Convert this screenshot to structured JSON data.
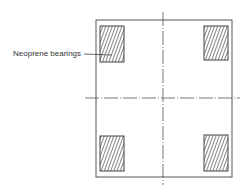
{
  "diagram": {
    "type": "plan view",
    "label": "Neoprene bearings",
    "colors": {
      "line": "#555555",
      "hatch": "#444444",
      "background": "#ffffff"
    },
    "elements": {
      "slab": {
        "x": 96,
        "y": 20,
        "width": 136,
        "height": 157
      },
      "bearings": [
        {
          "position": "top-left",
          "x": 100,
          "y": 26,
          "width": 24,
          "height": 36
        },
        {
          "position": "top-right",
          "x": 204,
          "y": 26,
          "width": 24,
          "height": 34
        },
        {
          "position": "bottom-left",
          "x": 100,
          "y": 136,
          "width": 24,
          "height": 35
        },
        {
          "position": "bottom-right",
          "x": 204,
          "y": 135,
          "width": 24,
          "height": 36
        }
      ],
      "centerlines": [
        {
          "orientation": "vertical",
          "x": 163,
          "y1": 12,
          "y2": 185
        },
        {
          "orientation": "horizontal",
          "y": 98,
          "x1": 85,
          "x2": 240
        }
      ]
    }
  }
}
